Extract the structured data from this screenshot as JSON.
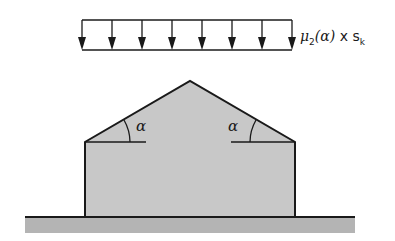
{
  "diagram": {
    "type": "snow load on duopitch roof",
    "load": {
      "label_mu": "μ",
      "label_sub": "2",
      "label_arg": "(α)",
      "label_times": " x s",
      "label_sk_sub": "k",
      "arrow_count": 8,
      "arrow_x": [
        82,
        112,
        142,
        172,
        202,
        232,
        262,
        292
      ]
    },
    "roof": {
      "angle_left": "α",
      "angle_right": "α"
    },
    "colors": {
      "fill": "#c8c8c8",
      "ground": "#b4b4b4",
      "stroke": "#1a1a1a"
    }
  }
}
